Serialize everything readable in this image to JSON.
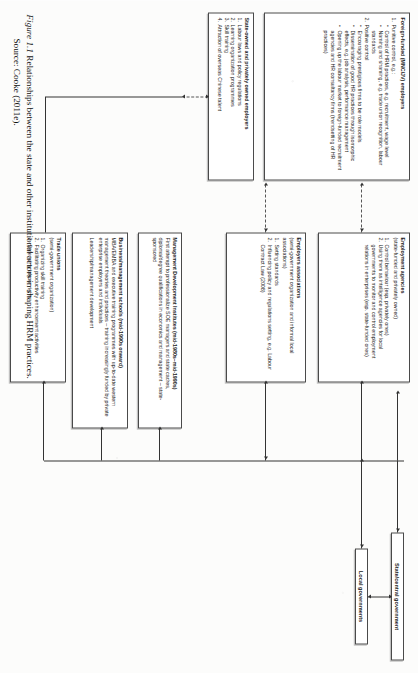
{
  "figure": {
    "number": "Figure 1.1",
    "title": "Relationships between the state and other institutional actors in shaping HRM practices.",
    "source": "Source: Cooke (2011e)."
  },
  "government": {
    "state_central": "State/central government",
    "local": "Local governments"
  },
  "boxes": {
    "foreign_funded": {
      "header": "Foreign-funded (MNC/JV) employers",
      "items": [
        {
          "n": "1.",
          "text": "Punitive control, e.g.:"
        },
        {
          "bullets": [
            "Control of HRM practices, e.g. recruitment, wage level",
            "Naming and shaming, e.g. trade union recognition, labour standards"
          ]
        },
        {
          "n": "2.",
          "text": "Positive control"
        },
        {
          "bullets": [
            "Encouraging prestigious firms to be role models",
            "Dissemination of good HR practices through isomorphic effects, e.g. job analysis, performance management",
            "Opening up the labour market to foreign-funded recruitment agencies and HR consultancy firms (trendsetting of HR practices)"
          ]
        }
      ]
    },
    "state_owned": {
      "header": "State-owned and privately owned employers",
      "items": [
        {
          "n": "1.",
          "text": "Labour laws and policy regulations"
        },
        {
          "n": "2.",
          "text": "Learning organization programmes"
        },
        {
          "n": "3.",
          "text": "Skill training"
        },
        {
          "n": "4.",
          "text": "Attraction of overseas Chinese talent"
        }
      ]
    },
    "employment_agencies": {
      "header": "Employment agencies",
      "sub": "(state-funded and privately owned)",
      "items": [
        {
          "n": "1.",
          "text": "Control behaviour (esp. privately ones)"
        },
        {
          "n": "2.",
          "text": "Using them as intelligence agencies for local governments to monitor and control employment relations in enterprises (esp. state-funded ones)"
        }
      ]
    },
    "employers_associations": {
      "header": "Employers associations",
      "sub": "(semi-government organization and informal local associations)",
      "items": [
        {
          "n": "1.",
          "text": "Setting standards"
        },
        {
          "n": "2.",
          "text": "Influencing policy and regulations setting, e.g. Labour Contract Law (2008)"
        }
      ]
    },
    "trade_unions": {
      "header": "Trade unions",
      "sub": "(semi-government organization)",
      "items": [
        {
          "n": "1.",
          "text": "Organizing skill training"
        },
        {
          "n": "2.",
          "text": "Facilitating productivity enhancement activities"
        },
        {
          "n": "3.",
          "text": "Defending labour rights"
        }
      ]
    },
    "management_development_institutes": {
      "header": "Management Development Institutes (mid-1980s–mid-1990s)",
      "body": "First attempt to professionalize SOE managers and state cadres, diploma/degree qualifications in economics and management – state-sponsored"
    },
    "business_schools": {
      "header": "Business/management schools (mid-1990s onward)",
      "body": "MBA/EMBA and executive training programmes with up-to-date western management theories and practices – training increasingly funded by private enterprise employers and individuals",
      "footer": "Leadership/management development"
    }
  },
  "colors": {
    "border": "#4a4a4a",
    "text": "#1c1c1c",
    "page": "#fcfcfb",
    "connector": "#333333"
  }
}
